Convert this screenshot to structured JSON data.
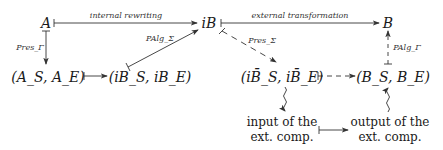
{
  "nodes": {
    "A": "A",
    "iB": "iB",
    "B": "B",
    "A_pair": "(A_S, A_E)",
    "iB_pair": "(iB_S, iB_E)",
    "iBbar_pair": "(iB̄_S, iB̄_E)",
    "B_pair": "(B_S, B_E)",
    "input_line1": "input of the",
    "input_line2": "ext. comp.",
    "output_line1": "output of the",
    "output_line2": "ext. comp."
  },
  "edges": {
    "internal_rewriting": "internal rewriting",
    "external_transformation": "external transformation",
    "pres_gamma": "Pres_Γ",
    "palg_sigma": "PAlg_Σ",
    "pres_sigma": "Pres_Σ",
    "palg_gamma": "PAlg_Γ"
  },
  "colors": {
    "ink": "#1a1a1a",
    "line": "#333333"
  }
}
